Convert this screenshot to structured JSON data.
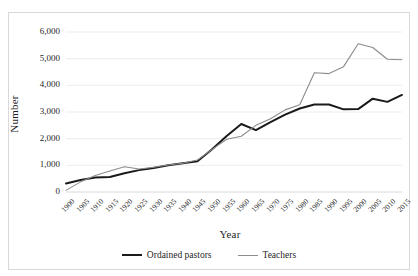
{
  "chart_data": {
    "type": "line",
    "title": "",
    "xlabel": "Year",
    "ylabel": "Number",
    "grid": true,
    "grid_axis": "y",
    "legend_position": "bottom",
    "xlim": [
      1900,
      2015
    ],
    "ylim": [
      0,
      6000
    ],
    "ytick_labels": [
      "0",
      "1,000",
      "2,000",
      "3,000",
      "4,000",
      "5,000",
      "6,000"
    ],
    "yticks": [
      0,
      1000,
      2000,
      3000,
      4000,
      5000,
      6000
    ],
    "categories": [
      "1900",
      "1905",
      "1910",
      "1915",
      "1920",
      "1925",
      "1930",
      "1935",
      "1940",
      "1945",
      "1950",
      "1955",
      "1960",
      "1965",
      "1970",
      "1975",
      "1980",
      "1985",
      "1990",
      "1995",
      "2000",
      "2005",
      "2010",
      "2015"
    ],
    "series": [
      {
        "name": "Ordained pastors",
        "color": "#1a1a1a",
        "width": 2.0,
        "values": [
          320,
          450,
          540,
          560,
          700,
          820,
          900,
          1000,
          1080,
          1150,
          1600,
          2100,
          2550,
          2320,
          2620,
          2900,
          3130,
          3280,
          3280,
          3100,
          3110,
          3500,
          3380,
          3640
        ]
      },
      {
        "name": "Teachers",
        "color": "#8c8c8c",
        "width": 1.1,
        "values": [
          60,
          380,
          620,
          790,
          950,
          860,
          930,
          1010,
          1080,
          1200,
          1600,
          1980,
          2090,
          2500,
          2750,
          3080,
          3270,
          4470,
          4440,
          4700,
          5560,
          5420,
          4980,
          4960
        ]
      }
    ]
  },
  "legend": {
    "items": [
      {
        "label": "Ordained pastors",
        "color": "#1a1a1a",
        "width": 2.0
      },
      {
        "label": "Teachers",
        "color": "#8c8c8c",
        "width": 1.1
      }
    ]
  },
  "colors": {
    "frame_border": "#d9d9d9",
    "gridline": "#ededed",
    "text": "#1f1f1f",
    "background": "#ffffff"
  }
}
